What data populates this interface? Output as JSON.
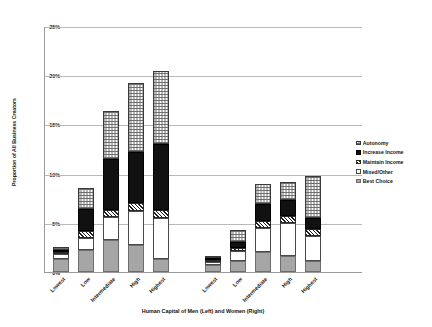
{
  "chart_data": {
    "type": "bar",
    "subtype": "stacked-vertical",
    "title": "",
    "xlabel": "Human Capital of Men (Left) and Women (Right)",
    "ylabel": "Proportion of All Business Creators",
    "ylim": [
      0,
      25
    ],
    "ytick_labels": [
      "0%",
      "5%",
      "10%",
      "15%",
      "20%",
      "25%"
    ],
    "ytick_values": [
      0,
      5,
      10,
      15,
      20,
      25
    ],
    "grid": "horizontal",
    "legend_position": "right",
    "groups": [
      "Men (Left)",
      "Women (Right)"
    ],
    "categories": [
      "Lowest",
      "Low",
      "Intermediate",
      "High",
      "Highest",
      "Lowest",
      "Low",
      "Intermediate",
      "High",
      "Highest"
    ],
    "series": [
      {
        "name": "Best Choice",
        "pattern": "solid-gray",
        "values": [
          1.3,
          2.2,
          3.3,
          2.7,
          1.3,
          0.7,
          1.1,
          2.0,
          1.6,
          1.1
        ]
      },
      {
        "name": "Mixed/Other",
        "pattern": "solid-white",
        "values": [
          0.5,
          1.3,
          2.3,
          3.5,
          4.2,
          0.3,
          1.0,
          2.5,
          3.4,
          2.6
        ]
      },
      {
        "name": "Maintain Income",
        "pattern": "diagonal-hatch",
        "values": [
          0.2,
          0.7,
          0.7,
          0.8,
          0.8,
          0.1,
          0.3,
          0.7,
          0.7,
          0.7
        ]
      },
      {
        "name": "Increase Income",
        "pattern": "solid-black",
        "values": [
          0.2,
          2.2,
          5.2,
          5.2,
          6.7,
          0.1,
          0.7,
          1.7,
          1.6,
          1.1
        ]
      },
      {
        "name": "Autonomy",
        "pattern": "checkered-dots",
        "values": [
          0.3,
          2.1,
          4.9,
          7.0,
          7.4,
          0.2,
          1.2,
          2.0,
          1.9,
          4.3
        ]
      }
    ],
    "totals": [
      2.5,
      8.5,
      16.4,
      19.2,
      20.4,
      1.4,
      4.3,
      8.9,
      9.2,
      9.8
    ],
    "legend_order_top_to_bottom": [
      "Autonomy",
      "Increase Income",
      "Maintain Income",
      "Mixed/Other",
      "Best Choice"
    ],
    "stack_order_bottom_to_top": [
      "Best Choice",
      "Mixed/Other",
      "Maintain Income",
      "Increase Income",
      "Autonomy"
    ]
  },
  "colors": {
    "best_choice": "#a6a6a6",
    "increase_income": "#111111",
    "mixed_other": "#ffffff",
    "gridline": "#b9b9b9",
    "axis": "#9a9a9a"
  }
}
